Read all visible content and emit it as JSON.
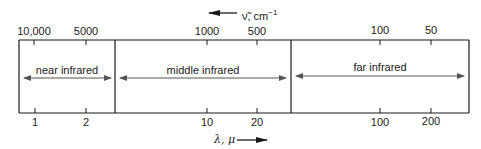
{
  "diagram": {
    "top_axis": {
      "label": "ν̃, cm",
      "exponent": "−1",
      "direction": "left",
      "ticks": [
        {
          "label": "10,000",
          "x": 34
        },
        {
          "label": "5000",
          "x": 86
        },
        {
          "label": "1000",
          "x": 207
        },
        {
          "label": "500",
          "x": 257
        },
        {
          "label": "100",
          "x": 380
        },
        {
          "label": "50",
          "x": 431
        }
      ]
    },
    "bottom_axis": {
      "label": "λ, μ",
      "direction": "right",
      "ticks": [
        {
          "label": "1",
          "x": 35
        },
        {
          "label": "2",
          "x": 86
        },
        {
          "label": "10",
          "x": 207
        },
        {
          "label": "20",
          "x": 257
        },
        {
          "label": "100",
          "x": 380
        },
        {
          "label": "200",
          "x": 431
        }
      ]
    },
    "regions": [
      {
        "label": "near infrared",
        "x_start": 19,
        "x_end": 115
      },
      {
        "label": "middle infrared",
        "x_start": 115,
        "x_end": 291
      },
      {
        "label": "far infrared",
        "x_start": 291,
        "x_end": 469
      }
    ],
    "colors": {
      "line": "#1a1a1a",
      "arrow": "#555555"
    }
  }
}
